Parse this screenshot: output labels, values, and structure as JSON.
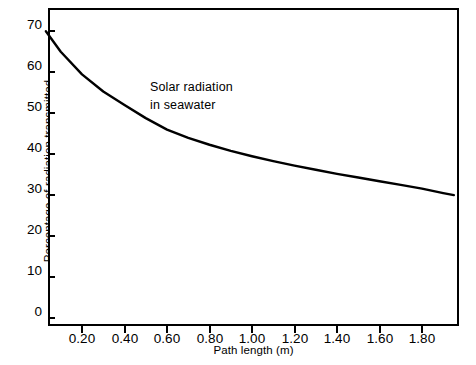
{
  "chart_data": {
    "type": "line",
    "title": "",
    "annotation": "Solar radiation\nin seawater",
    "xlabel": "Path length (m)",
    "ylabel": "Percentage of radiation transmitted",
    "xlim": [
      0.0,
      1.97
    ],
    "ylim": [
      0,
      75
    ],
    "grid": false,
    "legend": "none",
    "xticks": [
      0.2,
      0.4,
      0.6,
      0.8,
      1.0,
      1.2,
      1.4,
      1.6,
      1.8
    ],
    "xtick_labels": [
      "0.20",
      "0.40",
      "0.60",
      "0.80",
      "1.00",
      "1.20",
      "1.40",
      "1.60",
      "1.80"
    ],
    "yticks": [
      0,
      10,
      20,
      30,
      40,
      50,
      60,
      70
    ],
    "ytick_labels": [
      "0",
      "10",
      "20",
      "30",
      "40",
      "50",
      "60",
      "70"
    ],
    "series": [
      {
        "name": "Solar radiation in seawater",
        "color": "#000000",
        "x": [
          0.03,
          0.1,
          0.2,
          0.3,
          0.4,
          0.5,
          0.6,
          0.7,
          0.8,
          0.9,
          1.0,
          1.1,
          1.2,
          1.3,
          1.4,
          1.5,
          1.6,
          1.7,
          1.8,
          1.9,
          1.95
        ],
        "y": [
          70.0,
          65.0,
          59.5,
          55.3,
          52.0,
          48.8,
          46.0,
          44.0,
          42.3,
          40.8,
          39.5,
          38.3,
          37.2,
          36.2,
          35.2,
          34.3,
          33.4,
          32.5,
          31.6,
          30.5,
          30.0
        ]
      }
    ]
  }
}
